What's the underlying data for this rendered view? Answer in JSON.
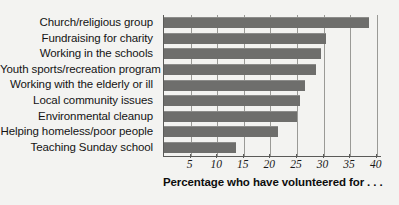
{
  "chart_data": {
    "type": "bar",
    "orientation": "horizontal",
    "title": "",
    "xlabel": "Percentage who have volunteered for . . .",
    "ylabel": "",
    "xlim": [
      0,
      41
    ],
    "xticks": [
      5,
      10,
      15,
      20,
      25,
      30,
      35,
      40
    ],
    "grid": true,
    "legend": false,
    "categories": [
      "Church/religious group",
      "Fundraising for charity",
      "Working in the schools",
      "Youth sports/recreation program",
      "Working with the elderly or ill",
      "Local community issues",
      "Environmental cleanup",
      "Helping homeless/poor people",
      "Teaching Sunday school"
    ],
    "values": [
      38.5,
      30.5,
      29.5,
      28.5,
      26.5,
      25.5,
      25,
      21.5,
      13.5
    ],
    "bar_color": "#6e6e6c",
    "background_color": "#f3f3f1",
    "axis_color": "#5a5a58",
    "gridline_color": "#9a9a96"
  }
}
